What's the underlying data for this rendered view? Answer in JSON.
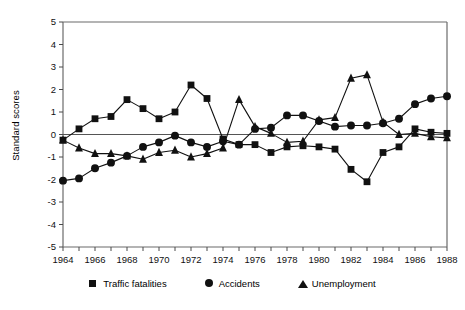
{
  "chart_data": {
    "type": "line",
    "title": "",
    "xlabel": "",
    "ylabel": "Standard scores",
    "xlim": [
      1964,
      1988
    ],
    "ylim": [
      -5,
      5
    ],
    "yticks": [
      -5,
      -4,
      -3,
      -2,
      -1,
      0,
      1,
      2,
      3,
      4,
      5
    ],
    "ytick_labels": [
      "-5",
      "-4",
      "-3",
      "-2",
      "-1",
      "0",
      "1",
      "2",
      "3",
      "4",
      "5"
    ],
    "xticks": [
      1964,
      1965,
      1966,
      1967,
      1968,
      1969,
      1970,
      1971,
      1972,
      1973,
      1974,
      1975,
      1976,
      1977,
      1978,
      1979,
      1980,
      1981,
      1982,
      1983,
      1984,
      1985,
      1986,
      1987,
      1988
    ],
    "xtick_labels": [
      "1964",
      "",
      "1966",
      "",
      "1968",
      "",
      "1970",
      "",
      "1972",
      "",
      "1974",
      "",
      "1976",
      "",
      "1978",
      "",
      "1980",
      "",
      "1982",
      "",
      "1984",
      "",
      "1986",
      "",
      "1988"
    ],
    "grid": false,
    "zero_line": true,
    "legend_position": "bottom",
    "x": [
      1964,
      1965,
      1966,
      1967,
      1968,
      1969,
      1970,
      1971,
      1972,
      1973,
      1974,
      1975,
      1976,
      1977,
      1978,
      1979,
      1980,
      1981,
      1982,
      1983,
      1984,
      1985,
      1986,
      1987,
      1988
    ],
    "series": [
      {
        "name": "Traffic fatalities",
        "marker": "square",
        "color": "#111111",
        "values": [
          -0.25,
          0.25,
          0.7,
          0.8,
          1.55,
          1.15,
          0.7,
          1.0,
          2.2,
          1.6,
          -0.2,
          -0.45,
          -0.45,
          -0.8,
          -0.55,
          -0.5,
          -0.55,
          -0.65,
          -1.55,
          -2.1,
          -0.8,
          -0.55,
          0.25,
          0.1,
          0.05
        ]
      },
      {
        "name": "Accidents",
        "marker": "circle",
        "color": "#111111",
        "values": [
          -2.05,
          -1.95,
          -1.5,
          -1.25,
          -0.95,
          -0.55,
          -0.35,
          -0.05,
          -0.35,
          -0.55,
          -0.3,
          -0.45,
          0.25,
          0.3,
          0.85,
          0.85,
          0.6,
          0.35,
          0.4,
          0.4,
          0.5,
          0.7,
          1.35,
          1.6,
          1.7
        ]
      },
      {
        "name": "Unemployment",
        "marker": "triangle",
        "color": "#111111",
        "values": [
          -0.25,
          -0.6,
          -0.85,
          -0.85,
          -0.95,
          -1.1,
          -0.8,
          -0.7,
          -1.0,
          -0.85,
          -0.6,
          1.55,
          0.35,
          0.05,
          -0.35,
          -0.3,
          0.65,
          0.75,
          2.5,
          2.65,
          0.55,
          0.0,
          0.05,
          -0.1,
          -0.15
        ]
      }
    ]
  },
  "legend": {
    "items": [
      {
        "label": "Traffic fatalities",
        "marker": "square"
      },
      {
        "label": "Accidents",
        "marker": "circle"
      },
      {
        "label": "Unemployment",
        "marker": "triangle"
      }
    ]
  }
}
